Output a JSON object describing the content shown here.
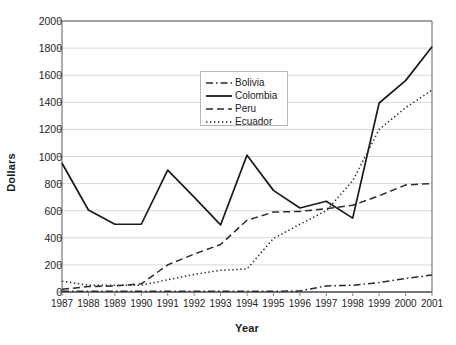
{
  "chart_data": {
    "type": "line",
    "title": "",
    "xlabel": "Year",
    "ylabel": "Dollars",
    "categories": [
      "1987",
      "1988",
      "1989",
      "1990",
      "1991",
      "1992",
      "1993",
      "1994",
      "1995",
      "1996",
      "1997",
      "1998",
      "1999",
      "2000",
      "2001"
    ],
    "x": [
      1987,
      1988,
      1989,
      1990,
      1991,
      1992,
      1993,
      1994,
      1995,
      1996,
      1997,
      1998,
      1999,
      2000,
      2001
    ],
    "ylim": [
      0,
      2000
    ],
    "yticks": [
      0,
      200,
      400,
      600,
      800,
      1000,
      1200,
      1400,
      1600,
      1800,
      2000
    ],
    "grid": "horizontal",
    "legend_position": "upper-center",
    "series": [
      {
        "name": "Bolivia",
        "style": "dash-dot",
        "color": "#2b2b2b",
        "values": [
          5,
          5,
          5,
          5,
          5,
          5,
          5,
          5,
          5,
          8,
          45,
          50,
          70,
          100,
          125
        ]
      },
      {
        "name": "Colombia",
        "style": "solid",
        "color": "#1a1a1a",
        "values": [
          950,
          605,
          500,
          500,
          900,
          700,
          495,
          1010,
          750,
          620,
          670,
          545,
          1395,
          1560,
          1810
        ]
      },
      {
        "name": "Peru",
        "style": "dashed",
        "color": "#2b2b2b",
        "values": [
          20,
          40,
          45,
          60,
          200,
          280,
          350,
          530,
          590,
          595,
          615,
          640,
          710,
          790,
          800
        ]
      },
      {
        "name": "Ecuador",
        "style": "dotted",
        "color": "#2b2b2b",
        "values": [
          80,
          50,
          50,
          50,
          90,
          130,
          160,
          170,
          395,
          500,
          600,
          820,
          1200,
          1360,
          1490
        ]
      }
    ]
  },
  "axis": {
    "y_title": "Dollars",
    "x_title": "Year"
  },
  "legend": {
    "items": [
      {
        "label": "Bolivia"
      },
      {
        "label": "Colombia"
      },
      {
        "label": "Peru"
      },
      {
        "label": "Ecuador"
      }
    ]
  }
}
